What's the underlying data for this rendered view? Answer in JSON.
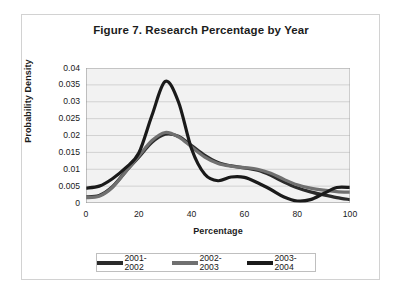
{
  "figure": {
    "title": "Figure 7. Research Percentage by Year",
    "frame_color": "#d2d2d2",
    "background": "#ffffff"
  },
  "chart_data": {
    "type": "line",
    "title": "Figure 7. Research Percentage by Year",
    "xlabel": "Percentage",
    "ylabel": "Probability Density",
    "xlim": [
      0,
      100
    ],
    "ylim": [
      0,
      0.04
    ],
    "xticks": [
      "0",
      "20",
      "40",
      "60",
      "80",
      "100"
    ],
    "xtick_values": [
      0,
      20,
      40,
      60,
      80,
      100
    ],
    "yticks": [
      "0",
      "0.005",
      "0.01",
      "0.015",
      "0.02",
      "0.025",
      "0.03",
      "0.035",
      "0.04"
    ],
    "ytick_values": [
      0,
      0.005,
      0.01,
      0.015,
      0.02,
      0.025,
      0.03,
      0.035,
      0.04
    ],
    "grid": "horizontal",
    "legend_position": "bottom",
    "plot_background": "#f2f2f2",
    "x": [
      0,
      5,
      10,
      15,
      20,
      25,
      30,
      35,
      40,
      45,
      50,
      55,
      60,
      65,
      70,
      75,
      80,
      85,
      90,
      95,
      100
    ],
    "series": [
      {
        "name": "2001-2002",
        "color": "#2b2b2b",
        "width": 3.2,
        "values": [
          0.0018,
          0.0022,
          0.0048,
          0.0093,
          0.0136,
          0.018,
          0.0204,
          0.0198,
          0.017,
          0.0141,
          0.012,
          0.011,
          0.0104,
          0.0097,
          0.0082,
          0.0062,
          0.0045,
          0.0033,
          0.0024,
          0.0016,
          0.001
        ]
      },
      {
        "name": "2002-2003",
        "color": "#707070",
        "width": 3.2,
        "values": [
          0.0016,
          0.002,
          0.0046,
          0.0092,
          0.0139,
          0.0185,
          0.0209,
          0.0196,
          0.0166,
          0.0136,
          0.0117,
          0.0109,
          0.0105,
          0.01,
          0.0088,
          0.007,
          0.0054,
          0.0044,
          0.0038,
          0.0034,
          0.0032
        ]
      },
      {
        "name": "2003-2004",
        "color": "#1a1a1a",
        "width": 3.2,
        "values": [
          0.0044,
          0.005,
          0.0072,
          0.0104,
          0.0148,
          0.026,
          0.036,
          0.03,
          0.016,
          0.0085,
          0.0066,
          0.0077,
          0.0076,
          0.006,
          0.004,
          0.0018,
          0.0006,
          0.001,
          0.0028,
          0.0046,
          0.0046
        ]
      }
    ]
  },
  "legend": {
    "items": [
      {
        "label": "2001-2002",
        "color": "#2b2b2b"
      },
      {
        "label": "2002-2003",
        "color": "#707070"
      },
      {
        "label": "2003-2004",
        "color": "#1a1a1a"
      }
    ]
  }
}
